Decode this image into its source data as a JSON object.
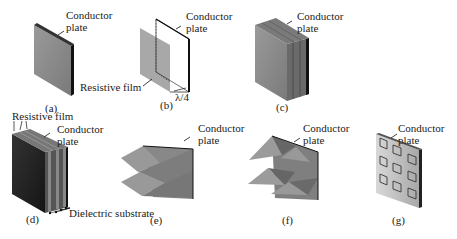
{
  "panels": [
    {
      "id": "a",
      "caption": "(a)",
      "labels": [
        "Conductor",
        "plate"
      ]
    },
    {
      "id": "b",
      "caption": "(b)",
      "labels": [
        "Conductor",
        "plate"
      ],
      "film_label": "Resistive film",
      "dimension_label": "λ/4"
    },
    {
      "id": "c",
      "caption": "(c)",
      "labels": [
        "Conductor",
        "plate"
      ]
    },
    {
      "id": "d",
      "caption": "(d)",
      "labels": [
        "Conductor",
        "plate"
      ],
      "film_label": "Resistive film",
      "substrate_label": "Dielectric substrate"
    },
    {
      "id": "e",
      "caption": "(e)",
      "labels": [
        "Conductor",
        "plate"
      ]
    },
    {
      "id": "f",
      "caption": "(f)",
      "labels": [
        "Conductor",
        "plate"
      ]
    },
    {
      "id": "g",
      "caption": "(g)",
      "labels": [
        "Conductor",
        "plate"
      ]
    }
  ],
  "colors": {
    "plate_gray": "#8a8a8a",
    "plate_dark": "#2a2a2a",
    "film_gray": "#b5b5b5",
    "edge_black": "#111111"
  }
}
